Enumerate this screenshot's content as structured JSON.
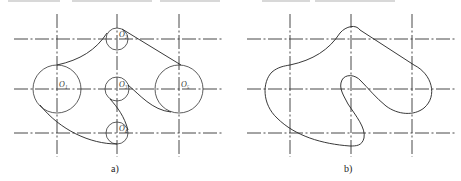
{
  "figure": {
    "top_text_fragment": "",
    "panels": [
      {
        "id": "a",
        "caption": "a)",
        "circles": [
          {
            "label": "O1",
            "cx": 57,
            "cy": 89,
            "r": 24
          },
          {
            "label": "O2",
            "cx": 117,
            "cy": 39,
            "r": 11
          },
          {
            "label": "O3",
            "cx": 117,
            "cy": 89,
            "r": 12
          },
          {
            "label": "O4",
            "cx": 117,
            "cy": 133,
            "r": 11
          },
          {
            "label": "O5",
            "cx": 179,
            "cy": 89,
            "r": 24
          }
        ]
      },
      {
        "id": "b",
        "caption": "b)"
      }
    ],
    "labels": {
      "o1": "O₁",
      "o2": "O₂",
      "o3": "O₃",
      "o4": "O₄",
      "o5": "O₅"
    },
    "captions": {
      "a": "a)",
      "b": "b)"
    }
  }
}
